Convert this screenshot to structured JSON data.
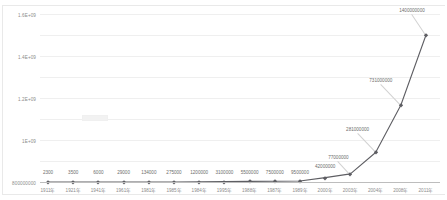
{
  "chart_data": {
    "type": "line",
    "title": "",
    "xlabel": "",
    "ylabel": "",
    "grid": true,
    "legend": "none",
    "ylim": [
      0,
      1600000000
    ],
    "categories": [
      "1911年",
      "1921年",
      "1941年",
      "1961年",
      "1981年",
      "1985年",
      "1984年",
      "1995年",
      "1988年",
      "1987年",
      "1989年",
      "2000年",
      "2003年",
      "2004年",
      "2008年",
      "2011年"
    ],
    "x": [
      "1911年",
      "1921年",
      "1941年",
      "1961年",
      "1981年",
      "1985年",
      "1984年",
      "1995年",
      "1988年",
      "1987年",
      "1989年",
      "2000年",
      "2003年",
      "2004年",
      "2008年",
      "2011年"
    ],
    "values": [
      2300,
      3500,
      6000,
      29000,
      134000,
      275000,
      1200000,
      3100000,
      5500000,
      7500000,
      9500000,
      42000000,
      77000000,
      281000000,
      731000000,
      1400000000
    ],
    "point_labels": [
      "2300",
      "3500",
      "6000",
      "29000",
      "134000",
      "275000",
      "1200000",
      "3100000",
      "5500000",
      "7500000",
      "9500000",
      "42000000",
      "77000000",
      "281000000",
      "731000000",
      "1400000000"
    ],
    "ytick_labels": [
      "1.6E+09",
      "1.4E+09",
      "1.2E+09",
      "1E+09",
      "800000000",
      "600000000",
      "400000000",
      "200000000",
      "0"
    ],
    "ytick_values": [
      1600000000,
      1400000000,
      1200000000,
      1000000000,
      800000000,
      600000000,
      400000000,
      200000000,
      0
    ],
    "series": [
      {
        "name": "series-1",
        "color": "#5e5e63",
        "values": [
          2300,
          3500,
          6000,
          29000,
          134000,
          275000,
          1200000,
          3100000,
          5500000,
          7500000,
          9500000,
          42000000,
          77000000,
          281000000,
          731000000,
          1400000000
        ]
      }
    ]
  },
  "colors": {
    "line": "#5e5e63",
    "marker": "#5e5e63",
    "grid": "#efefef",
    "axis": "#bdbdbd",
    "tick_text": "#8c8c8c",
    "label_text": "#6d6d6d",
    "background": "#ffffff"
  }
}
